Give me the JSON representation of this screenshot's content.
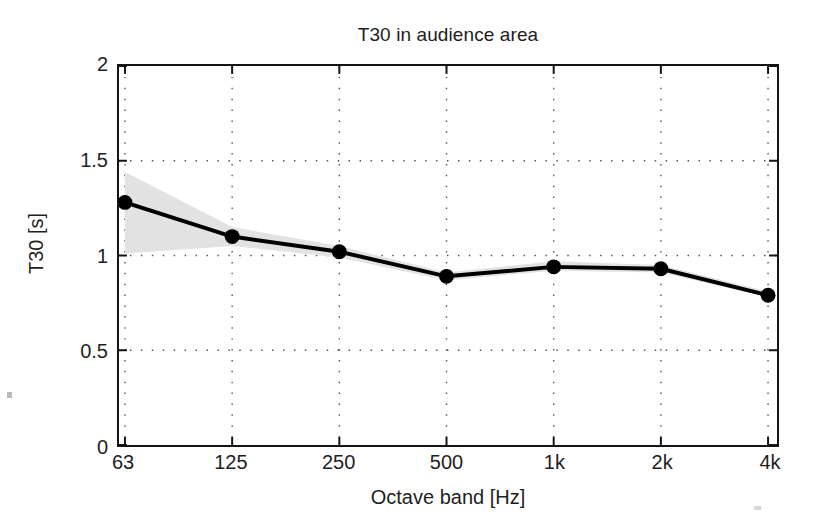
{
  "chart_data": {
    "type": "line",
    "title": "T30 in audience area",
    "xlabel": "Octave band [Hz]",
    "ylabel": "T30 [s]",
    "categories": [
      "63",
      "125",
      "250",
      "500",
      "1k",
      "2k",
      "4k"
    ],
    "values": [
      1.28,
      1.1,
      1.02,
      0.89,
      0.94,
      0.93,
      0.79
    ],
    "series": [
      {
        "name": "T30",
        "values": [
          1.28,
          1.1,
          1.02,
          0.89,
          0.94,
          0.93,
          0.79
        ],
        "marker": "filled-circle",
        "color": "#000000"
      }
    ],
    "band": {
      "name": "spatial deviation",
      "color": "#e2e2e2",
      "upper": [
        1.44,
        1.15,
        1.05,
        0.91,
        0.97,
        0.95,
        0.81
      ],
      "lower": [
        1.01,
        1.05,
        0.99,
        0.87,
        0.92,
        0.91,
        0.78
      ]
    },
    "ylim": [
      0,
      2
    ],
    "yticks": [
      "0",
      "0.5",
      "1",
      "1.5",
      "2"
    ],
    "ytick_values": [
      0,
      0.5,
      1,
      1.5,
      2
    ],
    "xticks": [
      "63",
      "125",
      "250",
      "500",
      "1k",
      "2k",
      "4k"
    ],
    "grid": "dotted",
    "legend": "none",
    "axis_color": "#141414",
    "grid_color": "#555555",
    "background": "#ffffff"
  }
}
